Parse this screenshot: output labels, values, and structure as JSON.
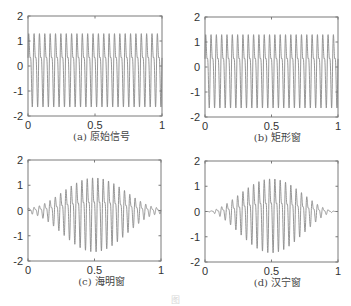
{
  "colors": {
    "signal": "#8a8a8a",
    "axes": "#7a7a7a",
    "text": "#333333"
  },
  "figure_caption": "图",
  "chart_data": [
    {
      "type": "line",
      "id": "a",
      "title": "(a) 原始信号",
      "xlabel": "",
      "ylabel": "",
      "xlim": [
        0,
        1
      ],
      "ylim": [
        -2,
        2
      ],
      "xticks": [
        "0",
        "0.5",
        "1"
      ],
      "yticks": [
        "2",
        "1",
        "0",
        "-1",
        "-2"
      ],
      "window": "none",
      "signal": "sin(2π·25t) + 0.5·sin(2π·50t)",
      "peak_amplitude": 1.5,
      "fundamental_cycles": 25
    },
    {
      "type": "line",
      "id": "b",
      "title": "(b) 矩形窗",
      "xlabel": "",
      "ylabel": "",
      "xlim": [
        0,
        1
      ],
      "ylim": [
        -2,
        2
      ],
      "xticks": [
        "0",
        "0.5",
        "1"
      ],
      "yticks": [
        "2",
        "1",
        "0",
        "-1",
        "-2"
      ],
      "window": "rectangular",
      "signal": "sin(2π·25t) + 0.5·sin(2π·50t)",
      "peak_amplitude": 1.5,
      "fundamental_cycles": 25
    },
    {
      "type": "line",
      "id": "c",
      "title": "(c) 海明窗",
      "xlabel": "",
      "ylabel": "",
      "xlim": [
        0,
        1
      ],
      "ylim": [
        -2,
        2
      ],
      "xticks": [
        "0",
        "0.5",
        "1"
      ],
      "yticks": [
        "2",
        "1",
        "0",
        "-1",
        "-2"
      ],
      "window": "hamming",
      "signal": "sin(2π·25t) + 0.5·sin(2π·50t)",
      "peak_amplitude": 1.5,
      "fundamental_cycles": 25
    },
    {
      "type": "line",
      "id": "d",
      "title": "(d) 汉宁窗",
      "xlabel": "",
      "ylabel": "",
      "xlim": [
        0,
        1
      ],
      "ylim": [
        -2,
        2
      ],
      "xticks": [
        "0",
        "0.5",
        "1"
      ],
      "yticks": [
        "2",
        "1",
        "0",
        "-1",
        "-2"
      ],
      "window": "hanning",
      "signal": "sin(2π·25t) + 0.5·sin(2π·50t)",
      "peak_amplitude": 1.5,
      "fundamental_cycles": 25
    }
  ]
}
